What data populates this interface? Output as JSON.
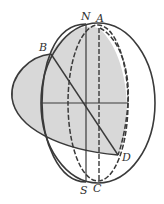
{
  "diagram": {
    "type": "celestial-sphere-geometry",
    "labels": {
      "N": "N",
      "A": "A",
      "B": "B",
      "D": "D",
      "S": "S",
      "C": "C"
    },
    "colors": {
      "stroke": "#3a3a3a",
      "shade": "#d6d6d6",
      "background": "#ffffff"
    }
  }
}
